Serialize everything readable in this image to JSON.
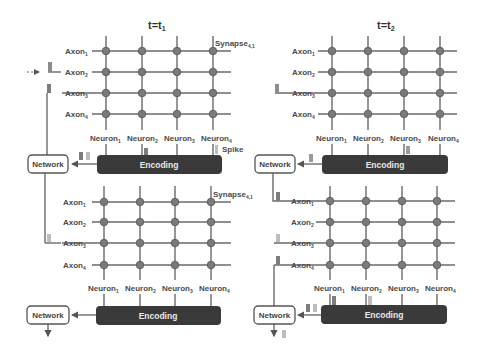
{
  "panels": [
    {
      "title": "t=t",
      "title_sub": "1",
      "top": {
        "axons": [
          "Axon",
          "Axon",
          "Axon",
          "Axon"
        ],
        "axon_subs": [
          "1",
          "2",
          "3",
          "4"
        ],
        "neurons": [
          "Neuron",
          "Neuron",
          "Neuron",
          "Neuron"
        ],
        "neuron_subs": [
          "1",
          "2",
          "3",
          "4"
        ],
        "synapse_label": "Synapse",
        "synapse_sub": "4,1",
        "spike_label": "Spike",
        "encoding_label": "Encoding",
        "network_label": "Network"
      },
      "bottom": {
        "axons": [
          "Axon",
          "Axon",
          "Axon",
          "Axon"
        ],
        "axon_subs": [
          "1",
          "2",
          "3",
          "4"
        ],
        "neurons": [
          "Neuron",
          "Neuron",
          "Neuron",
          "Neuron"
        ],
        "neuron_subs": [
          "1",
          "2",
          "3",
          "4"
        ],
        "synapse_label": "Synapse",
        "synapse_sub": "4,1",
        "encoding_label": "Encoding",
        "network_label": "Network"
      }
    },
    {
      "title": "t=t",
      "title_sub": "2",
      "top": {
        "axons": [
          "Axon",
          "Axon",
          "Axon",
          "Axon"
        ],
        "axon_subs": [
          "1",
          "2",
          "3",
          "4"
        ],
        "neurons": [
          "Neuron",
          "Neuron",
          "Neuron",
          "Neuron"
        ],
        "neuron_subs": [
          "1",
          "2",
          "3",
          "4"
        ],
        "encoding_label": "Encoding",
        "network_label": "Network"
      },
      "bottom": {
        "axons": [
          "Axon",
          "Axon",
          "Axon",
          "Axon"
        ],
        "axon_subs": [
          "1",
          "2",
          "3",
          "4"
        ],
        "neurons": [
          "Neuron",
          "Neuron",
          "Neuron",
          "Neuron"
        ],
        "neuron_subs": [
          "1",
          "2",
          "3",
          "4"
        ],
        "encoding_label": "Encoding",
        "network_label": "Network"
      }
    }
  ],
  "colors": {
    "line": "#6a6a6a",
    "synapse": "#7a7a7a",
    "encoding_bg": "#3a3a3a",
    "spike_dark": "#7d7d7d",
    "spike_light": "#bdbdbd"
  }
}
